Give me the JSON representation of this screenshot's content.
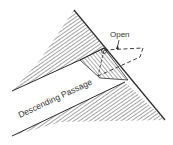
{
  "diagram": {
    "title": "",
    "labels": {
      "open": "Open",
      "passage": "Descending Passage",
      "pivot": "a"
    },
    "colors": {
      "line": "#2a2a2a",
      "hatch": "#555555",
      "background": "#ffffff"
    },
    "parts": [
      "pyramid-face-edge",
      "upper-rock-mass",
      "lower-rock-mass",
      "pivot-block",
      "open-door-outline",
      "descending-passage"
    ]
  }
}
